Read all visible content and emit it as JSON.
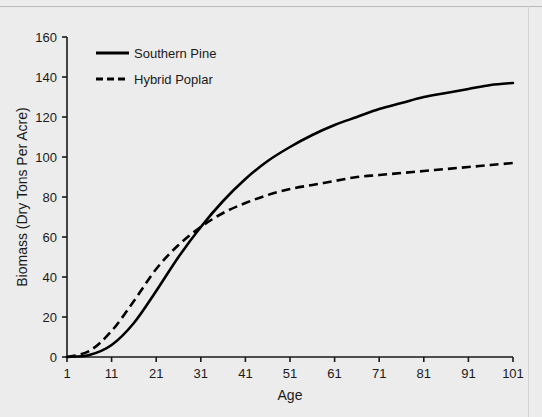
{
  "chart_data": {
    "type": "line",
    "title": "",
    "xlabel": "Age",
    "ylabel": "Biomass (Dry Tons Per Acre)",
    "xlim": [
      1,
      101
    ],
    "ylim": [
      0,
      160
    ],
    "xticks": [
      1,
      11,
      21,
      31,
      41,
      51,
      61,
      71,
      81,
      91,
      101
    ],
    "yticks": [
      0,
      20,
      40,
      60,
      80,
      100,
      120,
      140,
      160
    ],
    "grid": false,
    "legend_position": "top-left",
    "x": [
      1,
      6,
      11,
      16,
      21,
      26,
      31,
      36,
      41,
      46,
      51,
      56,
      61,
      66,
      71,
      76,
      81,
      86,
      91,
      96,
      101
    ],
    "series": [
      {
        "name": "Southern Pine",
        "style": "solid",
        "color": "#000000",
        "values": [
          0,
          1,
          6,
          17,
          33,
          50,
          65,
          78,
          89,
          98,
          105,
          111,
          116,
          120,
          124,
          127,
          130,
          132,
          134,
          136,
          137
        ]
      },
      {
        "name": "Hybrid Poplar",
        "style": "dashed",
        "color": "#000000",
        "values": [
          0,
          3,
          13,
          28,
          44,
          56,
          65,
          72,
          77,
          81,
          84,
          86,
          88,
          90,
          91,
          92,
          93,
          94,
          95,
          96,
          97
        ]
      }
    ],
    "annotations": [
      "Curves cross at approximately Age 22, Biomass 53"
    ]
  },
  "legend": {
    "items": [
      {
        "label": "Southern Pine",
        "style": "solid"
      },
      {
        "label": "Hybrid Poplar",
        "style": "dashed"
      }
    ]
  },
  "axis": {
    "x_title": "Age",
    "y_title": "Biomass (Dry Tons Per Acre)",
    "x_tick_labels": [
      "1",
      "11",
      "21",
      "31",
      "41",
      "51",
      "61",
      "71",
      "81",
      "91",
      "101"
    ],
    "y_tick_labels": [
      "0",
      "20",
      "40",
      "60",
      "80",
      "100",
      "120",
      "140",
      "160"
    ]
  },
  "colors": {
    "background": "#ececec",
    "axis": "#1a1a1a",
    "line": "#000000"
  }
}
